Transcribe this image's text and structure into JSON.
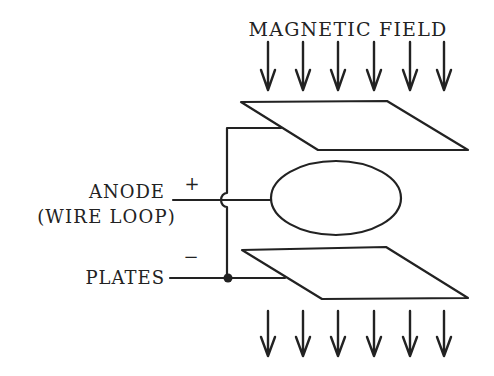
{
  "diagram": {
    "title_label": "MAGNETIC FIELD",
    "labels": {
      "anode": "ANODE",
      "anode_sub": "(WIRE LOOP)",
      "plates": "PLATES",
      "plus": "+",
      "minus": "−"
    },
    "components": [
      "top-plate",
      "anode-wire-loop",
      "bottom-plate"
    ],
    "field_arrows": {
      "top_count": 6,
      "bottom_count": 6,
      "direction": "down",
      "x_positions": [
        268,
        303,
        338,
        374,
        410,
        444
      ]
    },
    "colors": {
      "ink": "#222222",
      "background": "#ffffff"
    }
  }
}
